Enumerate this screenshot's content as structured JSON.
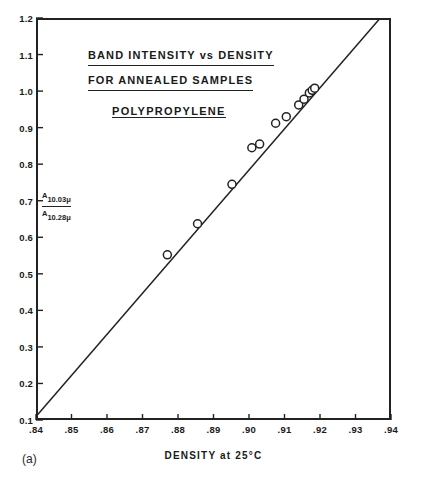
{
  "figure": {
    "panel_label": "(a)",
    "title_lines": [
      "BAND INTENSITY vs DENSITY",
      "FOR  ANNEALED  SAMPLES"
    ],
    "subtitle": "POLYPROPYLENE",
    "y_axis_annotation": {
      "numerator_symbol": "A",
      "numerator_subscript": "10.03μ",
      "denominator_symbol": "A",
      "denominator_subscript": "10.28μ"
    },
    "x_axis_title": "DENSITY  at  25°C"
  },
  "chart_data": {
    "type": "scatter",
    "title": "BAND INTENSITY vs DENSITY FOR ANNEALED SAMPLES",
    "subtitle": "POLYPROPYLENE",
    "xlabel": "DENSITY at 25°C",
    "ylabel": "A 10.03μ / A 10.28μ",
    "xlim": [
      0.84,
      0.94
    ],
    "ylim": [
      0.1,
      1.2
    ],
    "grid": false,
    "legend": null,
    "x_ticks": [
      0.84,
      0.85,
      0.86,
      0.87,
      0.88,
      0.89,
      0.9,
      0.91,
      0.92,
      0.93,
      0.94
    ],
    "x_tick_labels": [
      ".84",
      ".85",
      ".86",
      ".87",
      ".88",
      ".89",
      ".90",
      ".91",
      ".92",
      ".93",
      ".94"
    ],
    "y_ticks": [
      0.1,
      0.2,
      0.3,
      0.4,
      0.5,
      0.6,
      0.7,
      0.8,
      0.9,
      1.0,
      1.1,
      1.2
    ],
    "y_tick_labels": [
      "0.1",
      "0.2",
      "0.3",
      "0.4",
      "0.5",
      "0.6",
      "0.7",
      "0.8",
      "0.9",
      "1.0",
      "1.1",
      "1.2"
    ],
    "marker": "open-circle",
    "points": [
      {
        "x": 0.877,
        "y": 0.552
      },
      {
        "x": 0.8855,
        "y": 0.637
      },
      {
        "x": 0.8952,
        "y": 0.745
      },
      {
        "x": 0.9008,
        "y": 0.845
      },
      {
        "x": 0.903,
        "y": 0.855
      },
      {
        "x": 0.9075,
        "y": 0.912
      },
      {
        "x": 0.9105,
        "y": 0.93
      },
      {
        "x": 0.914,
        "y": 0.962
      },
      {
        "x": 0.9155,
        "y": 0.978
      },
      {
        "x": 0.917,
        "y": 0.995
      },
      {
        "x": 0.9178,
        "y": 1.002
      },
      {
        "x": 0.9185,
        "y": 1.008
      }
    ],
    "fit_line": {
      "type": "line",
      "x": [
        0.8405,
        0.9368
      ],
      "y": [
        0.115,
        1.198
      ],
      "description": "straight regression line through data"
    }
  }
}
